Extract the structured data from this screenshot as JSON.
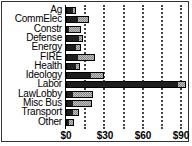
{
  "chart_data": {
    "type": "bar",
    "orientation": "horizontal",
    "stacked": true,
    "title": "",
    "xlabel": "",
    "ylabel": "",
    "categories": [
      "Ag",
      "CommElec",
      "Constr",
      "Defense",
      "Energy",
      "FIRE",
      "Health",
      "Ideology",
      "Labor",
      "LawLobby",
      "Misc Bus",
      "Transport",
      "Other"
    ],
    "series": [
      {
        "name": "dark",
        "color": "#1e1e1e",
        "values": [
          6,
          9,
          2,
          11,
          8,
          9,
          8,
          20,
          88,
          5,
          5,
          6,
          2
        ]
      },
      {
        "name": "checkered",
        "color": "#bdbdbd",
        "values": [
          2,
          9,
          10,
          2,
          4,
          14,
          3,
          10,
          6,
          16,
          15,
          4,
          4
        ]
      }
    ],
    "totals": [
      8,
      18,
      12,
      13,
      12,
      23,
      11,
      30,
      94,
      21,
      20,
      10,
      6
    ],
    "xticks": [
      "$0",
      "$30",
      "$60",
      "$90"
    ],
    "xlim": [
      0,
      90
    ],
    "grid": true,
    "legend": null
  },
  "axis": {
    "ticks": [
      {
        "label": "$0",
        "x": 66
      },
      {
        "label": "$30",
        "x": 105
      },
      {
        "label": "$60",
        "x": 143
      },
      {
        "label": "$90",
        "x": 181
      }
    ]
  }
}
